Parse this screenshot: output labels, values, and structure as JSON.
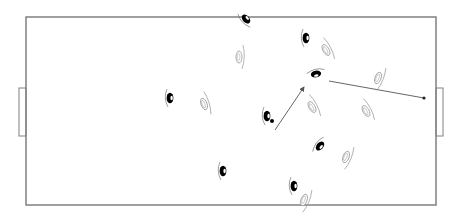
{
  "diagram": {
    "type": "football-tactics-board",
    "colors": {
      "background": "#ffffff",
      "pitch_line": "#808080",
      "team_a": "#000000",
      "team_b": "#9a9a9a",
      "arrow": "#555555"
    },
    "pitch": {
      "x": 26,
      "y": 17,
      "width": 410,
      "height": 188
    },
    "goals": [
      {
        "side": "left",
        "x": 19,
        "y": 88,
        "width": 7,
        "height": 48
      },
      {
        "side": "right",
        "x": 436,
        "y": 88,
        "width": 7,
        "height": 48
      }
    ],
    "team_a_players": [
      {
        "id": "a1",
        "x": 170,
        "y": 98,
        "rot": 0
      },
      {
        "id": "a2",
        "x": 246,
        "y": 19,
        "rot": -40
      },
      {
        "id": "a3",
        "x": 306,
        "y": 38,
        "rot": 0
      },
      {
        "id": "a4",
        "x": 267,
        "y": 116,
        "rot": 0
      },
      {
        "id": "a5",
        "x": 316,
        "y": 74,
        "rot": 80
      },
      {
        "id": "a6",
        "x": 320,
        "y": 146,
        "rot": 40
      },
      {
        "id": "a7",
        "x": 223,
        "y": 171,
        "rot": 0
      },
      {
        "id": "a8",
        "x": 294,
        "y": 186,
        "rot": 0
      }
    ],
    "team_b_players": [
      {
        "id": "b1",
        "x": 204,
        "y": 104,
        "rot": 160
      },
      {
        "id": "b2",
        "x": 239,
        "y": 57,
        "rot": 180
      },
      {
        "id": "b3",
        "x": 326,
        "y": 50,
        "rot": 150
      },
      {
        "id": "b4",
        "x": 378,
        "y": 78,
        "rot": 200
      },
      {
        "id": "b5",
        "x": 312,
        "y": 107,
        "rot": 150
      },
      {
        "id": "b6",
        "x": 366,
        "y": 111,
        "rot": 150
      },
      {
        "id": "b7",
        "x": 346,
        "y": 157,
        "rot": 200
      },
      {
        "id": "b8",
        "x": 304,
        "y": 200,
        "rot": 200
      }
    ],
    "ball": {
      "x": 272,
      "y": 121,
      "r": 2
    },
    "arrows": [
      {
        "id": "pass-arrow",
        "x1": 275,
        "y1": 130,
        "x2": 304,
        "y2": 87,
        "head": "arrow"
      },
      {
        "id": "run-arrow",
        "x1": 329,
        "y1": 81,
        "x2": 424,
        "y2": 98,
        "head": "dot"
      }
    ]
  }
}
